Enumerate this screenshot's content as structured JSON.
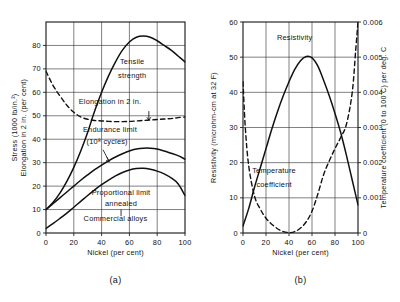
{
  "figure": {
    "background_color": "#ffffff",
    "ink_color": "#111111",
    "panels": [
      {
        "id": "panel-a",
        "caption": "(a)"
      },
      {
        "id": "panel-b",
        "caption": "(b)"
      }
    ]
  },
  "chart_data": [
    {
      "type": "line",
      "id": "copper-nickel-mechanical-properties",
      "title": "",
      "caption": "(a)",
      "xlabel": "Nickel (per cent)",
      "ylabel": "Stress (1000 lb/in.²)   Elongation in 2 in. (per cent)",
      "ylabel_lines": [
        "Stress (1000 lb/in.²)",
        "Elongation in 2 in. (per cent)"
      ],
      "xlim": [
        0,
        100
      ],
      "ylim": [
        0,
        90
      ],
      "xticks": [
        0,
        20,
        40,
        60,
        80,
        100
      ],
      "xticklabels": [
        "0",
        "20",
        "40",
        "60",
        "80",
        "100"
      ],
      "yticks": [
        0,
        10,
        20,
        30,
        40,
        50,
        60,
        70,
        80
      ],
      "yticklabels": [
        "0",
        "10",
        "20",
        "30",
        "40",
        "50",
        "60",
        "70",
        "80"
      ],
      "grid": true,
      "legend_position": "inline-annotations",
      "annotations": [
        {
          "text": "Tensile",
          "x": 62,
          "y": 72
        },
        {
          "text": "strength",
          "x": 62,
          "y": 66
        },
        {
          "text": "Elongation in 2 in.",
          "x": 46,
          "y": 55
        },
        {
          "text": "Endurance limit",
          "x": 46,
          "y": 43
        },
        {
          "text": "(10⁸ cycles)",
          "x": 44,
          "y": 38
        },
        {
          "text": "Proportional limit",
          "x": 54,
          "y": 16
        },
        {
          "text": "annealed",
          "x": 54,
          "y": 11.5
        },
        {
          "text": "Commercial alloys",
          "x": 50,
          "y": 5
        }
      ],
      "series": [
        {
          "name": "Tensile strength",
          "style": "solid",
          "x": [
            0,
            5,
            10,
            15,
            20,
            25,
            30,
            35,
            40,
            45,
            50,
            55,
            60,
            65,
            70,
            75,
            80,
            85,
            90,
            95,
            100
          ],
          "values": [
            10,
            13,
            17,
            22,
            28,
            35,
            43,
            52,
            60,
            67,
            73,
            78,
            81.5,
            83.5,
            84,
            83.5,
            82,
            80,
            78,
            75.5,
            73
          ]
        },
        {
          "name": "Elongation in 2 in.",
          "style": "dashed",
          "x": [
            0,
            5,
            10,
            15,
            20,
            25,
            30,
            35,
            40,
            45,
            50,
            55,
            60,
            65,
            70,
            75,
            80,
            85,
            90,
            95,
            100
          ],
          "values": [
            69,
            63,
            58.5,
            54.5,
            51.5,
            49.5,
            48.5,
            48,
            47.8,
            47.6,
            47.5,
            47.5,
            47.6,
            47.8,
            48,
            48.2,
            48.4,
            48.6,
            48.8,
            49.2,
            49.5
          ]
        },
        {
          "name": "Endurance limit (10⁸ cycles)",
          "style": "solid",
          "x": [
            0,
            5,
            10,
            15,
            20,
            25,
            30,
            35,
            40,
            45,
            50,
            55,
            60,
            65,
            70,
            75,
            80,
            85,
            90,
            95,
            100
          ],
          "values": [
            10,
            12.5,
            15,
            17.5,
            20,
            22.5,
            24.8,
            27,
            29,
            30.8,
            32.4,
            33.8,
            35,
            35.8,
            36.2,
            36.2,
            35.8,
            35,
            34,
            33,
            31.5
          ]
        },
        {
          "name": "Proportional limit annealed",
          "style": "solid",
          "x": [
            0,
            5,
            10,
            15,
            20,
            25,
            30,
            35,
            40,
            45,
            50,
            55,
            60,
            65,
            70,
            75,
            80,
            85,
            90,
            95,
            100
          ],
          "values": [
            2,
            4,
            6.2,
            8.5,
            11,
            13.5,
            16,
            18.4,
            20.6,
            22.6,
            24.4,
            25.8,
            26.9,
            27.5,
            27.6,
            27.2,
            26.4,
            25.2,
            23.5,
            21,
            16
          ]
        }
      ]
    },
    {
      "type": "line",
      "id": "copper-nickel-electrical-properties",
      "title": "",
      "caption": "(b)",
      "xlabel": "Nickel (per cent)",
      "ylabel": "Resistivity (microhm-cm at 32 F)",
      "y2label": "Temperature coefficient (0 to 100 C) per deg. C",
      "xlim": [
        0,
        100
      ],
      "ylim": [
        0,
        60
      ],
      "y2lim": [
        0,
        0.006
      ],
      "xticks": [
        0,
        20,
        40,
        60,
        80,
        100
      ],
      "xticklabels": [
        "0",
        "20",
        "40",
        "60",
        "80",
        "100"
      ],
      "yticks": [
        0,
        10,
        20,
        30,
        40,
        50,
        60
      ],
      "yticklabels": [
        "0",
        "10",
        "20",
        "30",
        "40",
        "50",
        "60"
      ],
      "y2ticks": [
        0,
        0.001,
        0.002,
        0.003,
        0.004,
        0.005,
        0.006
      ],
      "y2ticklabels": [
        "0",
        "0.001",
        "0.002",
        "0.003",
        "0.004",
        "0.005",
        "0.006"
      ],
      "grid": true,
      "legend_position": "inline-annotations",
      "annotations": [
        {
          "text": "Resistivity",
          "x": 45,
          "y": 55
        },
        {
          "text": "Temperature",
          "x": 27,
          "y": 17
        },
        {
          "text": "coefficient",
          "x": 27,
          "y": 13
        }
      ],
      "series": [
        {
          "name": "Resistivity",
          "style": "solid",
          "axis": "left",
          "x": [
            0,
            5,
            10,
            15,
            20,
            25,
            30,
            35,
            40,
            45,
            50,
            55,
            60,
            65,
            70,
            75,
            80,
            85,
            90,
            95,
            100
          ],
          "values": [
            2,
            7,
            13,
            18.5,
            24,
            29.5,
            34.5,
            39,
            43,
            46.5,
            49,
            50.2,
            49.8,
            47.5,
            43.5,
            39,
            34,
            28.5,
            22,
            15,
            8
          ]
        },
        {
          "name": "Temperature coefficient",
          "style": "dashed",
          "axis": "right",
          "x": [
            0,
            2,
            5,
            10,
            15,
            20,
            25,
            30,
            35,
            40,
            45,
            50,
            55,
            60,
            65,
            70,
            75,
            80,
            85,
            90,
            95,
            98,
            100
          ],
          "values": [
            0.0043,
            0.003,
            0.0019,
            0.00105,
            0.00068,
            0.00042,
            0.00025,
            0.00012,
            4e-05,
            1e-05,
            4e-05,
            0.00014,
            0.00032,
            0.00062,
            0.0011,
            0.00165,
            0.00205,
            0.0024,
            0.00272,
            0.0031,
            0.004,
            0.0052,
            0.006
          ]
        }
      ]
    }
  ]
}
